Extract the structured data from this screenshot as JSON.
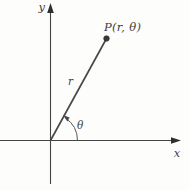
{
  "figure": {
    "type": "polar-coordinates-diagram"
  },
  "labels": {
    "y_axis": "y",
    "x_axis": "x",
    "point": "P(r, θ)",
    "radius": "r",
    "angle": "θ"
  },
  "colors": {
    "background": "#fdfdfc",
    "axis_line": "#454545",
    "ray_line": "#4a4a4a",
    "arc_line": "#555555",
    "point_fill": "#383838",
    "text": "#3d3d3d"
  }
}
